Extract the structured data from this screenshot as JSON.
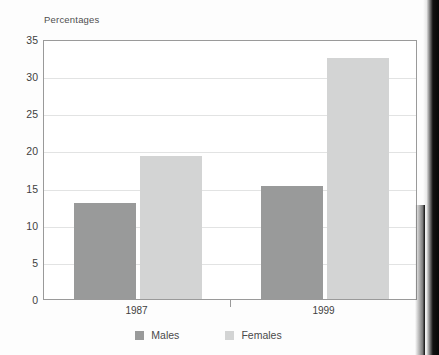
{
  "chart_data": {
    "type": "bar",
    "title": "Percentages",
    "xlabel": "",
    "ylabel": "",
    "categories": [
      "1987",
      "1999"
    ],
    "series": [
      {
        "name": "Males",
        "values": [
          12.9,
          15.2
        ],
        "color": "#999a9a"
      },
      {
        "name": "Females",
        "values": [
          19.2,
          32.5
        ],
        "color": "#d3d4d4"
      }
    ],
    "ylim": [
      0,
      35
    ],
    "ytick_labels": [
      "0",
      "5",
      "10",
      "15",
      "20",
      "25",
      "30",
      "35"
    ],
    "ytick_values": [
      0,
      5,
      10,
      15,
      20,
      25,
      30,
      35
    ],
    "grid": true,
    "legend_position": "bottom"
  },
  "legend": {
    "items": [
      {
        "label": "Males"
      },
      {
        "label": "Females"
      }
    ]
  }
}
